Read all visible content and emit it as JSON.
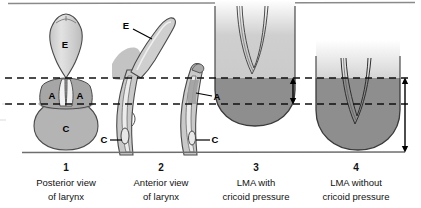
{
  "figure": {
    "title_rule": "top-horizontal-rule",
    "baseline": "bottom-horizontal-rule",
    "colors": {
      "outline": "#3a3a3a",
      "tissue_light": "#d5d5d5",
      "tissue_mid": "#bdbdbd",
      "tissue_dark": "#9a9a9a",
      "lma_upper": "#c9c9c9",
      "lma_lower": "#8f8f8f",
      "dashed": "#111111",
      "rule": "#8a8a8a",
      "text": "#111111"
    },
    "reference_lines": {
      "upper_dashed_label": "upper reference level",
      "lower_dashed_label": "lower reference level",
      "baseline_label": "baseline"
    },
    "measure_arrows": [
      {
        "name": "short-double-arrow",
        "span": "between upper and lower dashed lines"
      },
      {
        "name": "long-double-arrow",
        "span": "from upper dashed line to baseline"
      }
    ]
  },
  "anatomy_keys": [
    {
      "key": "E",
      "meaning": "epiglottis"
    },
    {
      "key": "A",
      "meaning": "arytenoid"
    },
    {
      "key": "C",
      "meaning": "cricoid"
    }
  ],
  "panels": [
    {
      "number": "1",
      "caption_line1": "Posterior view",
      "caption_line2": "of larynx",
      "labels": [
        {
          "text": "E",
          "x": 65,
          "y": 45
        },
        {
          "text": "A",
          "x": 52,
          "y": 96
        },
        {
          "text": "A",
          "x": 80,
          "y": 96
        },
        {
          "text": "C",
          "x": 66,
          "y": 129
        }
      ]
    },
    {
      "number": "2",
      "caption_line1": "Anterior view",
      "caption_line2": "of larynx",
      "labels": [
        {
          "text": "E",
          "x": 126,
          "y": 26
        },
        {
          "text": "A",
          "x": 203,
          "y": 97
        },
        {
          "text": "C",
          "x": 119,
          "y": 142
        },
        {
          "text": "C",
          "x": 203,
          "y": 142
        }
      ]
    },
    {
      "number": "3",
      "caption_line1": "LMA with",
      "caption_line2": "cricoid pressure",
      "labels": []
    },
    {
      "number": "4",
      "caption_line1": "LMA without",
      "caption_line2": "cricoid pressure",
      "labels": []
    }
  ]
}
